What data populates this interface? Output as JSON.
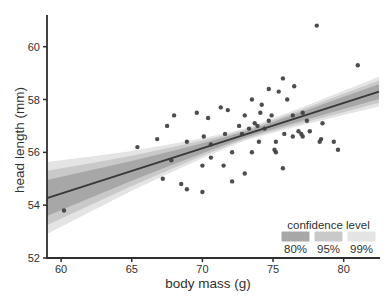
{
  "figure": {
    "width": 387,
    "height": 304,
    "background": "#ffffff",
    "text_color": "#303030",
    "axis_color": "#2e2e2e"
  },
  "chart_data": {
    "type": "scatter",
    "title": "",
    "xlabel": "body mass (g)",
    "ylabel": "head length (mm)",
    "xlim": [
      59.0,
      82.5
    ],
    "ylim": [
      52.0,
      61.2
    ],
    "xticks": [
      "60",
      "65",
      "70",
      "75",
      "80"
    ],
    "xtick_values": [
      60,
      65,
      70,
      75,
      80
    ],
    "yticks": [
      "52",
      "54",
      "56",
      "58",
      "60"
    ],
    "ytick_values": [
      52,
      54,
      56,
      58,
      60
    ],
    "grid": false,
    "point_color": "#3e3e3e",
    "point_radius": 2.2,
    "points": [
      [
        78.1,
        60.8
      ],
      [
        81.0,
        59.3
      ],
      [
        75.7,
        58.8
      ],
      [
        76.5,
        58.5
      ],
      [
        74.7,
        58.4
      ],
      [
        75.4,
        58.3
      ],
      [
        76.0,
        58.0
      ],
      [
        73.5,
        58.0
      ],
      [
        74.2,
        57.8
      ],
      [
        71.3,
        57.7
      ],
      [
        71.8,
        57.6
      ],
      [
        69.6,
        57.5
      ],
      [
        77.1,
        57.5
      ],
      [
        74.1,
        57.5
      ],
      [
        68.0,
        57.4
      ],
      [
        73.0,
        57.4
      ],
      [
        74.9,
        57.4
      ],
      [
        76.4,
        57.4
      ],
      [
        70.4,
        57.3
      ],
      [
        77.4,
        57.2
      ],
      [
        74.7,
        57.2
      ],
      [
        78.5,
        57.1
      ],
      [
        73.7,
        57.1
      ],
      [
        72.6,
        57.0
      ],
      [
        73.9,
        57.0
      ],
      [
        67.5,
        57.0
      ],
      [
        74.4,
        56.9
      ],
      [
        73.3,
        56.9
      ],
      [
        76.8,
        56.8
      ],
      [
        77.6,
        56.8
      ],
      [
        72.8,
        56.7
      ],
      [
        75.8,
        56.7
      ],
      [
        77.0,
        56.7
      ],
      [
        71.6,
        56.7
      ],
      [
        76.4,
        56.6
      ],
      [
        77.1,
        56.6
      ],
      [
        70.1,
        56.6
      ],
      [
        66.8,
        56.5
      ],
      [
        78.4,
        56.5
      ],
      [
        68.9,
        56.4
      ],
      [
        75.2,
        56.4
      ],
      [
        74.0,
        56.4
      ],
      [
        78.3,
        56.4
      ],
      [
        79.3,
        56.4
      ],
      [
        70.6,
        56.3
      ],
      [
        65.4,
        56.2
      ],
      [
        75.1,
        56.1
      ],
      [
        79.6,
        56.1
      ],
      [
        73.5,
        56.0
      ],
      [
        75.2,
        56.0
      ],
      [
        72.1,
        56.0
      ],
      [
        70.6,
        55.8
      ],
      [
        67.8,
        55.7
      ],
      [
        70.0,
        55.5
      ],
      [
        71.5,
        55.5
      ],
      [
        75.7,
        55.4
      ],
      [
        73.0,
        55.2
      ],
      [
        67.2,
        55.0
      ],
      [
        72.1,
        54.9
      ],
      [
        68.5,
        54.8
      ],
      [
        68.9,
        54.6
      ],
      [
        70.0,
        54.5
      ],
      [
        60.2,
        53.8
      ]
    ],
    "regression_line": {
      "x": [
        59.0,
        82.5
      ],
      "y": [
        54.27,
        58.3
      ],
      "color": "#383838"
    },
    "confidence_bands": {
      "x": [
        59,
        62,
        65,
        68,
        70,
        72,
        73,
        74,
        76,
        78,
        80,
        82.5
      ],
      "halfwidth_99": [
        1.36,
        1.05,
        0.75,
        0.52,
        0.38,
        0.27,
        0.23,
        0.24,
        0.3,
        0.38,
        0.46,
        0.56
      ]
    },
    "legend": {
      "title": "confidence level",
      "position": "bottom-right",
      "entries": [
        {
          "label": "80%",
          "scale": 0.5,
          "color": "#a7a7a7"
        },
        {
          "label": "95%",
          "scale": 0.76,
          "color": "#c9c9c9"
        },
        {
          "label": "99%",
          "scale": 1.0,
          "color": "#e4e4e4"
        }
      ]
    }
  }
}
